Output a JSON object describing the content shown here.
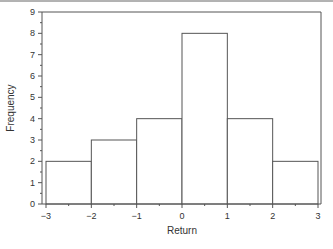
{
  "chart_data": {
    "type": "bar",
    "subtype": "histogram",
    "title": "",
    "xlabel": "Return",
    "ylabel": "Frequency",
    "bins": [
      {
        "from": -3,
        "to": -2,
        "count": 2
      },
      {
        "from": -2,
        "to": -1,
        "count": 3
      },
      {
        "from": -1,
        "to": 0,
        "count": 4
      },
      {
        "from": 0,
        "to": 1,
        "count": 8
      },
      {
        "from": 1,
        "to": 2,
        "count": 4
      },
      {
        "from": 2,
        "to": 3,
        "count": 2
      }
    ],
    "categories": [
      "-3 to -2",
      "-2 to -1",
      "-1 to 0",
      "0 to 1",
      "1 to 2",
      "2 to 3"
    ],
    "values": [
      2,
      3,
      4,
      8,
      4,
      2
    ],
    "xlim": [
      -3,
      3
    ],
    "ylim": [
      0,
      9
    ],
    "xticks": [
      "−3",
      "−2",
      "−1",
      "0",
      "1",
      "2",
      "3"
    ],
    "yticks": [
      "0",
      "1",
      "2",
      "3",
      "4",
      "5",
      "6",
      "7",
      "8",
      "9"
    ],
    "minor_ticks": true,
    "grid": false,
    "legend": null,
    "colors": {
      "bar_fill": "#ffffff",
      "bar_edge": "#555555",
      "axis": "#555555",
      "text": "#333333"
    }
  }
}
